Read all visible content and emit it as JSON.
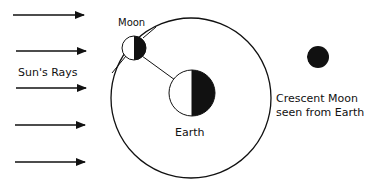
{
  "diagram": {
    "labels": {
      "sun_rays": "Sun's Rays",
      "moon": "Moon",
      "earth": "Earth",
      "crescent_line1": "Crescent Moon",
      "crescent_line2": "seen from Earth"
    },
    "ray_count": 5,
    "colors": {
      "ink": "#111111",
      "background": "#ffffff"
    }
  }
}
